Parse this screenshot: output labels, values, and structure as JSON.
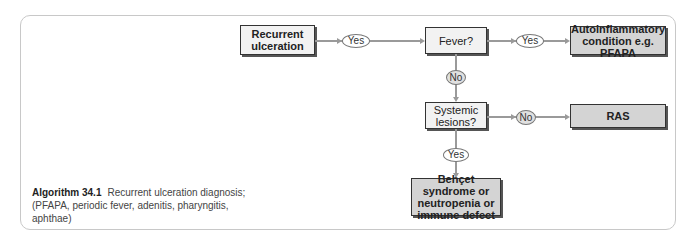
{
  "diagram": {
    "nodes": {
      "recurrent": {
        "label": "Recurrent ulceration"
      },
      "fever": {
        "label": "Fever?"
      },
      "autoinflammatory": {
        "label": "Autoinflammatory condition e.g. PFAPA"
      },
      "systemic": {
        "label": "Systemic lesions?"
      },
      "ras": {
        "label": "RAS"
      },
      "behcet": {
        "label": "Behçet syndrome or neutropenia or immune defect"
      }
    },
    "edges": {
      "recurrent_to_fever": "Yes",
      "fever_to_autoinflammatory": "Yes",
      "fever_to_systemic": "No",
      "systemic_to_ras": "No",
      "systemic_to_behcet": "Yes"
    }
  },
  "caption": {
    "label": "Algorithm 34.1",
    "text": "Recurrent ulceration diagnosis; (PFAPA, periodic fever, adenitis, pharyngitis, aphthae)"
  },
  "colors": {
    "terminal_fill": "#d4d4d4",
    "decision_fill": "#f2f2f2",
    "connector": "#9a9a9a"
  }
}
